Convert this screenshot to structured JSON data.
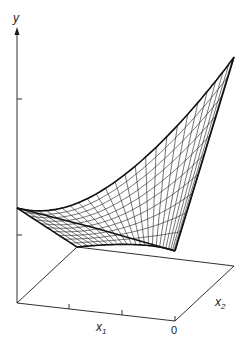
{
  "figure": {
    "axis_labels": {
      "y": "y",
      "x1": "x",
      "x1_sub": "1",
      "x2": "x",
      "x2_sub": "2",
      "origin": "0"
    },
    "colors": {
      "line": "#1a1a1a",
      "background": "#ffffff"
    }
  }
}
